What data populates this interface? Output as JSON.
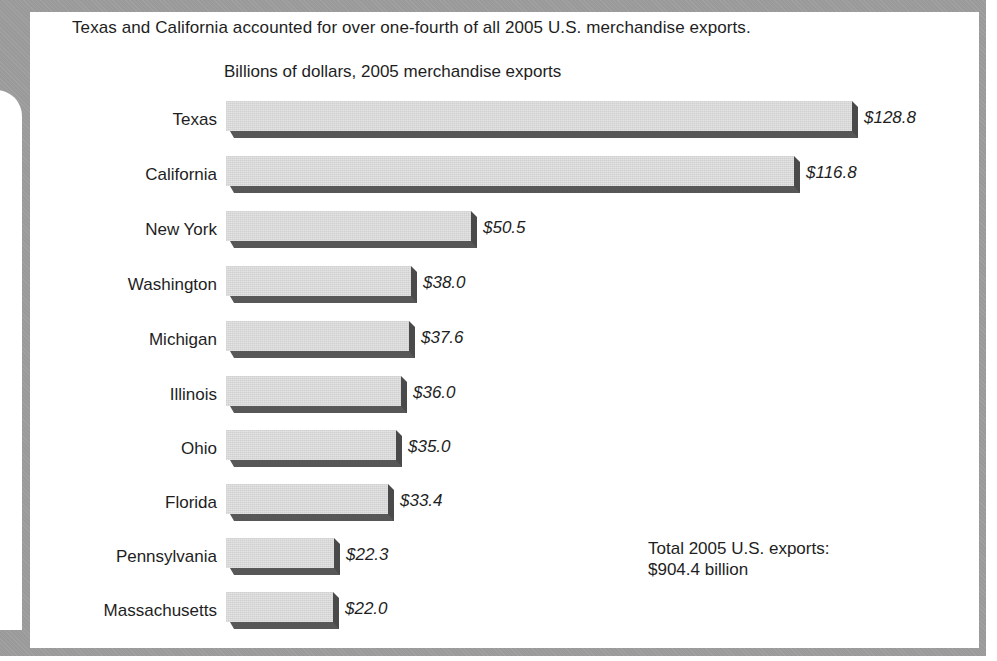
{
  "chart": {
    "title": "Texas and California accounted for over one-fourth of all 2005 U.S. merchandise exports.",
    "subtitle": "Billions of dollars, 2005 merchandise exports",
    "total_note_line1": "Total 2005 U.S. exports:",
    "total_note_line2": "$904.4 billion",
    "colors": {
      "frame": "#9a9a9a",
      "bar_face": "#d9d9d9",
      "bar_shadow": "#575757",
      "text": "#1e1e1e"
    },
    "rows": [
      {
        "label": "Texas",
        "value": 128.8,
        "value_label": "$128.8"
      },
      {
        "label": "California",
        "value": 116.8,
        "value_label": "$116.8"
      },
      {
        "label": "New York",
        "value": 50.5,
        "value_label": "$50.5"
      },
      {
        "label": "Washington",
        "value": 38.0,
        "value_label": "$38.0"
      },
      {
        "label": "Michigan",
        "value": 37.6,
        "value_label": "$37.6"
      },
      {
        "label": "Illinois",
        "value": 36.0,
        "value_label": "$36.0"
      },
      {
        "label": "Ohio",
        "value": 35.0,
        "value_label": "$35.0"
      },
      {
        "label": "Florida",
        "value": 33.4,
        "value_label": "$33.4"
      },
      {
        "label": "Pennsylvania",
        "value": 22.3,
        "value_label": "$22.3"
      },
      {
        "label": "Massachusetts",
        "value": 22.0,
        "value_label": "$22.0"
      }
    ]
  },
  "chart_data": {
    "type": "bar",
    "orientation": "horizontal",
    "title": "Texas and California accounted for over one-fourth of all 2005 U.S. merchandise exports.",
    "subtitle": "Billions of dollars, 2005 merchandise exports",
    "categories": [
      "Texas",
      "California",
      "New York",
      "Washington",
      "Michigan",
      "Illinois",
      "Ohio",
      "Florida",
      "Pennsylvania",
      "Massachusetts"
    ],
    "values": [
      128.8,
      116.8,
      50.5,
      38.0,
      37.6,
      36.0,
      35.0,
      33.4,
      22.3,
      22.0
    ],
    "value_labels": [
      "$128.8",
      "$116.8",
      "$50.5",
      "$38.0",
      "$37.6",
      "$36.0",
      "$35.0",
      "$33.4",
      "$22.3",
      "$22.0"
    ],
    "xlabel": "",
    "ylabel": "",
    "unit": "Billions of dollars",
    "annotations": [
      "Total 2005 U.S. exports: $904.4 billion"
    ],
    "grid": false,
    "legend": null
  }
}
